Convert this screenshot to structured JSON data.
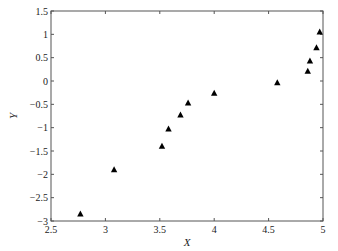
{
  "chart_data": {
    "type": "scatter",
    "title": "",
    "xlabel": "X",
    "ylabel": "Y",
    "xlim": [
      2.5,
      5
    ],
    "ylim": [
      -3,
      1.5
    ],
    "xticks": [
      2.5,
      3,
      3.5,
      4,
      4.5,
      5
    ],
    "xtick_labels": [
      "2.5",
      "3",
      "3.5",
      "4",
      "4.5",
      "5"
    ],
    "yticks": [
      1.5,
      1,
      0.5,
      0,
      -0.5,
      -1,
      -1.5,
      -2,
      -2.5,
      -3
    ],
    "ytick_labels": [
      "1.5",
      "1",
      "0.5",
      "0",
      "−0.5",
      "−1",
      "−1.5",
      "−2",
      "−2.5",
      "−3"
    ],
    "grid": false,
    "legend": null,
    "marker": "triangle",
    "marker_color": "#000000",
    "series": [
      {
        "name": "data",
        "x": [
          2.77,
          3.08,
          3.52,
          3.58,
          3.69,
          3.76,
          4.0,
          4.58,
          4.86,
          4.88,
          4.94,
          4.97
        ],
        "y": [
          -2.85,
          -1.9,
          -1.4,
          -1.03,
          -0.73,
          -0.47,
          -0.26,
          -0.04,
          0.21,
          0.43,
          0.71,
          1.05
        ]
      }
    ]
  }
}
